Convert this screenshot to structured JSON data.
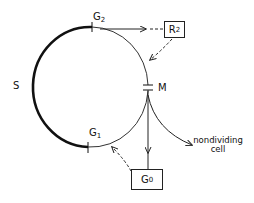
{
  "diagram": {
    "title": "",
    "phases": {
      "S": {
        "label": "S"
      },
      "G2": {
        "label": "G",
        "sub": "2"
      },
      "M": {
        "label": "M"
      },
      "G1": {
        "label": "G",
        "sub": "1"
      }
    },
    "boxes": {
      "R2": {
        "label": "R",
        "sub": "2"
      },
      "G0": {
        "label": "G",
        "sub": "0"
      }
    },
    "exit_label": {
      "line1": "nondividing",
      "line2": "cell"
    }
  }
}
